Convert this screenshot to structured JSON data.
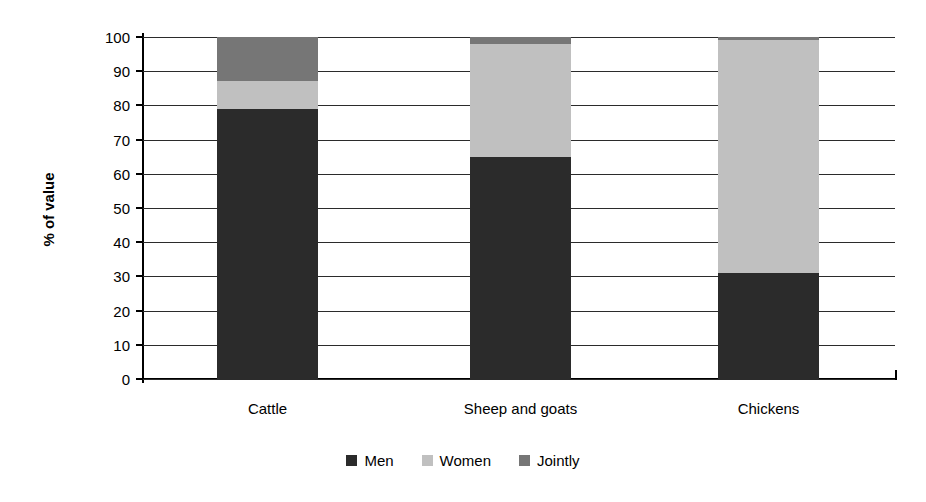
{
  "chart_data": {
    "type": "bar",
    "subtype": "stacked-100-percent",
    "title": "",
    "subtitle": "",
    "xlabel": "",
    "ylabel": "% of value",
    "ylim": [
      0,
      100
    ],
    "ytick_labels": [
      "100",
      "90",
      "80",
      "70",
      "60",
      "50",
      "40",
      "30",
      "20",
      "10",
      "0"
    ],
    "ytick_values": [
      100,
      90,
      80,
      70,
      60,
      50,
      40,
      30,
      20,
      10,
      0
    ],
    "grid": true,
    "grid_axis": "y",
    "legend_position": "bottom",
    "categories": [
      "Cattle",
      "Sheep and goats",
      "Chickens"
    ],
    "series": [
      {
        "name": "Men",
        "color": "#2b2b2b",
        "values": [
          79,
          65,
          31
        ]
      },
      {
        "name": "Women",
        "color": "#c0c0c0",
        "values": [
          8,
          33,
          68
        ]
      },
      {
        "name": "Jointly",
        "color": "#767676",
        "values": [
          13,
          2,
          1
        ]
      }
    ]
  },
  "colors": {
    "men": "#2b2b2b",
    "women": "#c0c0c0",
    "jointly": "#767676",
    "axis": "#000000",
    "grid": "#2b2b2b",
    "background": "#ffffff"
  }
}
